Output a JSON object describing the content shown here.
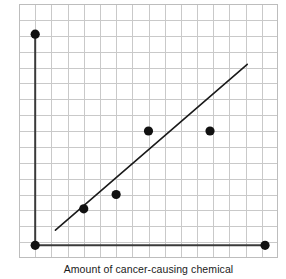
{
  "chart_data": {
    "type": "scatter",
    "title": "",
    "xlabel": "Amount of cancer-causing chemical",
    "ylabel": "Chance that rat will develop tumor",
    "xlim": [
      0,
      16
    ],
    "ylim": [
      0,
      16
    ],
    "grid": true,
    "grid_columns": 16,
    "grid_rows": 16,
    "xticklabels": [],
    "yticklabels": [],
    "legend": null,
    "points": [
      {
        "x": 1,
        "y": 14.1
      },
      {
        "x": 1,
        "y": 0.8
      },
      {
        "x": 4,
        "y": 3.1
      },
      {
        "x": 6,
        "y": 4.0
      },
      {
        "x": 8,
        "y": 8.0
      },
      {
        "x": 11.8,
        "y": 8.0
      },
      {
        "x": 15.2,
        "y": 0.8
      }
    ],
    "point_color": "#111111",
    "point_radius_px": 4.6,
    "trendline": {
      "label": "line of best fit",
      "x0": 2.25,
      "y0": 1.75,
      "x1": 14.1,
      "y1": 12.2,
      "color": "#1a1a1a",
      "width_px": 1.6
    },
    "axes": {
      "x_axis_value": 0.8,
      "y_axis_value": 1,
      "color": "#3a3a3a",
      "width_px": 2
    },
    "grid_color": "#c9c9c9",
    "border_color": "#bdbdbd",
    "background": "#ffffff"
  }
}
